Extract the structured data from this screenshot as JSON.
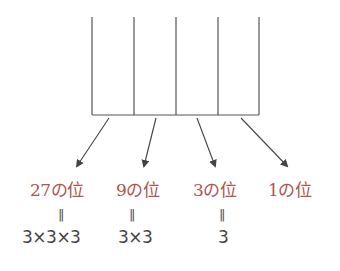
{
  "diagram": {
    "columns": 4,
    "place_labels": [
      "27の位",
      "9の位",
      "3の位",
      "1の位"
    ],
    "equals_sign": "‖",
    "expressions": [
      "3×3×3",
      "3×3",
      "3",
      ""
    ],
    "colors": {
      "label": "#b0544b",
      "line": "#555555",
      "expression": "#444444"
    }
  }
}
